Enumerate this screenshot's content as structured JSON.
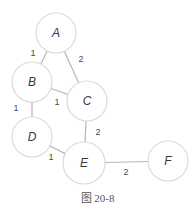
{
  "figure": {
    "caption": "图 20-8",
    "type": "weighted undirected graph"
  },
  "colors": {
    "node_stroke": "#d9d9d9",
    "edge_stroke": "#b5b5b5",
    "text": "#3a3a3a"
  },
  "nodes": [
    {
      "id": "A",
      "label": "A",
      "cx": 56,
      "cy": 33,
      "r": 20
    },
    {
      "id": "B",
      "label": "B",
      "cx": 32,
      "cy": 82,
      "r": 20
    },
    {
      "id": "C",
      "label": "C",
      "cx": 87,
      "cy": 101,
      "r": 20
    },
    {
      "id": "D",
      "label": "D",
      "cx": 32,
      "cy": 137,
      "r": 20
    },
    {
      "id": "E",
      "label": "E",
      "cx": 84,
      "cy": 163,
      "r": 21
    },
    {
      "id": "F",
      "label": "F",
      "cx": 168,
      "cy": 161,
      "r": 20
    }
  ],
  "edges": [
    {
      "from": "A",
      "to": "B",
      "weight": "1",
      "lx": 33,
      "ly": 56
    },
    {
      "from": "A",
      "to": "C",
      "weight": "2",
      "lx": 81,
      "ly": 62
    },
    {
      "from": "B",
      "to": "C",
      "weight": "1",
      "lx": 57,
      "ly": 105
    },
    {
      "from": "B",
      "to": "D",
      "weight": "1",
      "lx": 16,
      "ly": 111
    },
    {
      "from": "C",
      "to": "E",
      "weight": "2",
      "lx": 98,
      "ly": 135
    },
    {
      "from": "D",
      "to": "E",
      "weight": "1",
      "lx": 51,
      "ly": 160
    },
    {
      "from": "E",
      "to": "F",
      "weight": "2",
      "lx": 126,
      "ly": 175
    }
  ]
}
